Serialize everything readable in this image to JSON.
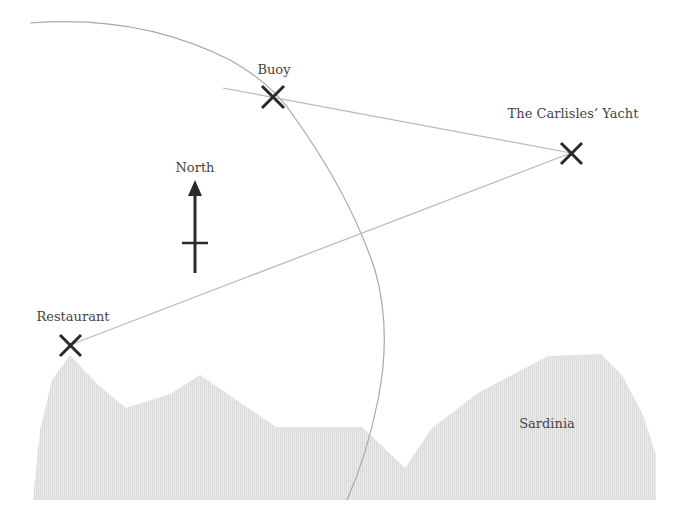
{
  "diagram": {
    "type": "navigation triangulation map",
    "colors": {
      "background": "#ffffff",
      "land": "#e4e4e4",
      "lines": "#b8b8b8",
      "arc": "#a8a8a8",
      "markers": "#2a2a2a",
      "text": "#444444"
    },
    "landmarks": [
      {
        "id": "buoy",
        "label": "Buoy",
        "x": 273,
        "y": 97,
        "label_x": 274,
        "label_y": 74
      },
      {
        "id": "yacht",
        "label": "The Carlisles’ Yacht",
        "x": 571,
        "y": 153,
        "label_x": 573,
        "label_y": 118
      },
      {
        "id": "restaurant",
        "label": "Restaurant",
        "x": 70,
        "y": 345,
        "label_x": 73,
        "label_y": 321
      }
    ],
    "compass": {
      "label": "North",
      "x": 195,
      "y_top": 180,
      "y_bottom": 272,
      "label_y": 172
    },
    "land": {
      "label": "Sardinia",
      "label_x": 547,
      "label_y": 428
    },
    "bearing_lines": [
      {
        "from": "yacht",
        "to": "buoy",
        "extends_past": true
      },
      {
        "from": "yacht",
        "to": "restaurant"
      }
    ],
    "range_arc": {
      "description": "circular arc of constant distance passing through buoy"
    }
  }
}
